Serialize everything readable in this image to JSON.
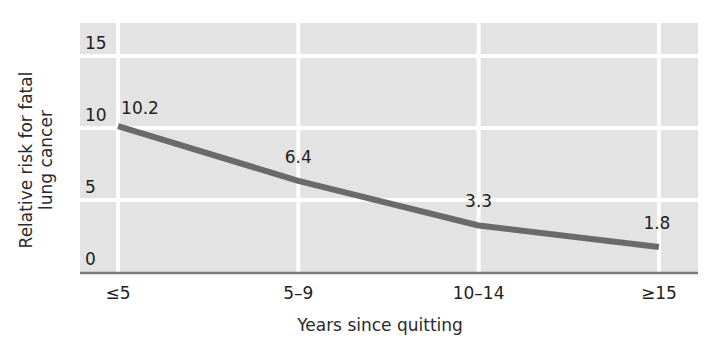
{
  "chart_data": {
    "type": "line",
    "title": "",
    "xlabel": "Years since quitting",
    "ylabel_lines": [
      "Relative risk for fatal",
      "lung cancer"
    ],
    "ylabel": "Relative risk for fatal lung cancer",
    "categories": [
      "≤5",
      "5–9",
      "10–14",
      "≥15"
    ],
    "series": [
      {
        "name": "Relative risk",
        "values": [
          10.2,
          6.4,
          3.3,
          1.8
        ],
        "data_labels": [
          "10.2",
          "6.4",
          "3.3",
          "1.8"
        ]
      }
    ],
    "ylim": [
      0,
      15
    ],
    "yticks": [
      0,
      5,
      10,
      15
    ],
    "ytick_labels": [
      "0",
      "5",
      "10",
      "15"
    ],
    "grid": true,
    "legend": "none"
  },
  "colors": {
    "plot_background": "#e3e3e3",
    "gridline": "#ffffff",
    "line": "#6a6a6a",
    "axis": "#7a7a7a",
    "text": "#222222"
  }
}
